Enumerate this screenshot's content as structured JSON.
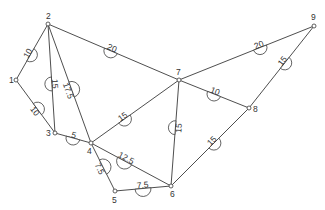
{
  "diagram": {
    "type": "weighted-undirected-graph",
    "colors": {
      "line": "#3a3a3a",
      "text": "#333333",
      "background": "#ffffff"
    },
    "nodes": [
      {
        "id": "1",
        "label": "1",
        "x": 16,
        "y": 80,
        "lx": -7,
        "ly": 3
      },
      {
        "id": "2",
        "label": "2",
        "x": 48,
        "y": 24,
        "lx": -2,
        "ly": -5
      },
      {
        "id": "3",
        "label": "3",
        "x": 55,
        "y": 133,
        "lx": -9,
        "ly": 3
      },
      {
        "id": "4",
        "label": "4",
        "x": 91,
        "y": 143,
        "lx": -4,
        "ly": 11
      },
      {
        "id": "5",
        "label": "5",
        "x": 115,
        "y": 191,
        "lx": -3,
        "ly": 12
      },
      {
        "id": "6",
        "label": "6",
        "x": 171,
        "y": 186,
        "lx": -1,
        "ly": 11
      },
      {
        "id": "7",
        "label": "7",
        "x": 179,
        "y": 80,
        "lx": -3,
        "ly": -5
      },
      {
        "id": "8",
        "label": "8",
        "x": 249,
        "y": 108,
        "lx": 4,
        "ly": 4
      },
      {
        "id": "9",
        "label": "9",
        "x": 314,
        "y": 26,
        "lx": -3,
        "ly": -6
      }
    ],
    "edges": [
      {
        "from": "1",
        "to": "2",
        "weight": "10",
        "t": 0.45,
        "side": -1
      },
      {
        "from": "1",
        "to": "3",
        "weight": "10",
        "t": 0.55,
        "side": 1
      },
      {
        "from": "2",
        "to": "3",
        "weight": "15",
        "t": 0.55,
        "side": -1
      },
      {
        "from": "2",
        "to": "4",
        "weight": "17.5",
        "t": 0.55,
        "side": 1
      },
      {
        "from": "2",
        "to": "7",
        "weight": "20",
        "t": 0.48,
        "side": -1
      },
      {
        "from": "3",
        "to": "4",
        "weight": "5",
        "t": 0.5,
        "side": -1
      },
      {
        "from": "4",
        "to": "7",
        "weight": "15",
        "t": 0.38,
        "side": -1
      },
      {
        "from": "4",
        "to": "6",
        "weight": "12.5",
        "t": 0.42,
        "side": -1
      },
      {
        "from": "4",
        "to": "5",
        "weight": "7.5",
        "t": 0.5,
        "side": 1
      },
      {
        "from": "5",
        "to": "6",
        "weight": "7.5",
        "t": 0.5,
        "side": -1
      },
      {
        "from": "6",
        "to": "7",
        "weight": "15",
        "t": 0.55,
        "side": 1
      },
      {
        "from": "6",
        "to": "8",
        "weight": "15",
        "t": 0.55,
        "side": -1
      },
      {
        "from": "7",
        "to": "8",
        "weight": "10",
        "t": 0.5,
        "side": -1
      },
      {
        "from": "7",
        "to": "9",
        "weight": "20",
        "t": 0.6,
        "side": -1
      },
      {
        "from": "8",
        "to": "9",
        "weight": "15",
        "t": 0.55,
        "side": -1
      }
    ]
  }
}
